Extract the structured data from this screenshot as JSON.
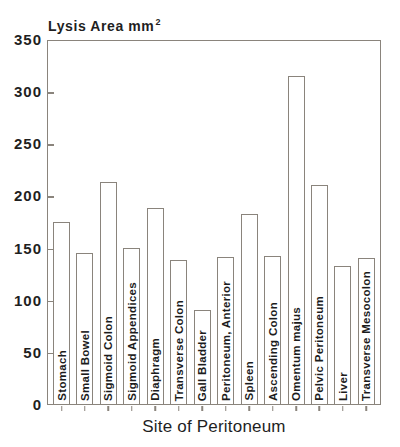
{
  "chart_data": {
    "type": "bar",
    "title": "Lysis Area mm",
    "title_superscript": "2",
    "xlabel": "Site of Peritoneum",
    "ylabel": "",
    "ylim": [
      0,
      350
    ],
    "yticks": [
      0,
      50,
      100,
      150,
      200,
      250,
      300,
      350
    ],
    "categories": [
      "Stomach",
      "Small Bowel",
      "Sigmoid Colon",
      "Sigmoid Appendices",
      "Diaphragm",
      "Transverse Colon",
      "Gall Bladder",
      "Peritoneum, Anterior",
      "Spleen",
      "Ascending Colon",
      "Omentum majus",
      "Pelvic Peritoneum",
      "Liver",
      "Transverse Mesocolon"
    ],
    "values": [
      175,
      145,
      213,
      150,
      188,
      138,
      90,
      141,
      182,
      142,
      315,
      210,
      132,
      140
    ],
    "bar_fill": "#ffffff",
    "line_color": "#8a847c",
    "text_color": "#1c1c1c",
    "grid": false,
    "legend": "none"
  }
}
